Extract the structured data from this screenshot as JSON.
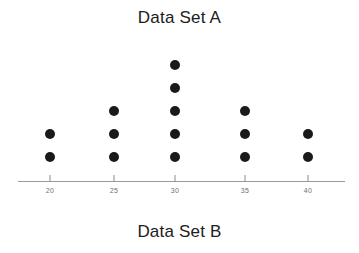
{
  "titles": {
    "top": "Data Set A",
    "bottom": "Data Set B"
  },
  "colors": {
    "dot": "#1a1a1a",
    "axis": "#9a9a9a",
    "tick_label": "#6f6f6f",
    "title": "#202020",
    "background": "#ffffff"
  },
  "chart_data": {
    "type": "scatter",
    "plot_style": "dot-plot",
    "title": "Data Set A",
    "subtitle": "Data Set B",
    "xlabel": "",
    "ylabel": "",
    "categories": [
      "20",
      "25",
      "30",
      "35",
      "40"
    ],
    "x": [
      20,
      25,
      30,
      35,
      40
    ],
    "values": [
      2,
      3,
      5,
      3,
      2
    ],
    "counts": [
      {
        "value": 20,
        "count": 2
      },
      {
        "value": 25,
        "count": 3
      },
      {
        "value": 30,
        "count": 5
      },
      {
        "value": 35,
        "count": 3
      },
      {
        "value": 40,
        "count": 2
      }
    ],
    "observations": [
      20,
      20,
      25,
      25,
      25,
      30,
      30,
      30,
      30,
      30,
      35,
      35,
      35,
      40,
      40
    ],
    "total_dots": 15,
    "xlim": [
      17.5,
      42.5
    ],
    "xtick_labels": [
      "20",
      "25",
      "30",
      "35",
      "40"
    ],
    "grid": false,
    "legend": false,
    "axis_visible": {
      "x": true,
      "y": false
    }
  },
  "layout": {
    "tick_px": [
      50,
      114,
      175,
      245,
      308
    ],
    "baseline_y_px": 157,
    "dot_spacing_px": 23
  }
}
